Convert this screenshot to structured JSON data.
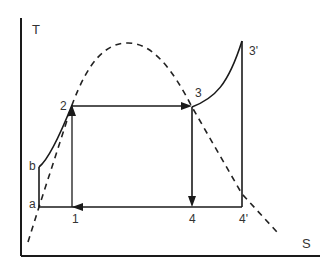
{
  "diagram": {
    "type": "T-S diagram (Rankine cycle with superheat)",
    "axes": {
      "y_label": "T",
      "x_label": "S"
    },
    "points": {
      "a": "a",
      "b": "b",
      "p1": "1",
      "p2": "2",
      "p3": "3",
      "p3_prime": "3'",
      "p4": "4",
      "p4_prime": "4'"
    },
    "colors": {
      "line": "#1a1a1a",
      "dome": "#222222",
      "text": "#333333",
      "background": "#ffffff"
    },
    "elements": [
      {
        "id": "saturation-dome",
        "style": "dashed",
        "description": "bell-shaped saturation curve"
      },
      {
        "id": "line-a-b",
        "from": "a",
        "to": "b",
        "style": "solid"
      },
      {
        "id": "curve-b-2",
        "from": "b",
        "to": "2",
        "style": "solid"
      },
      {
        "id": "line-1-2",
        "from": "1",
        "to": "2",
        "style": "solid",
        "arrow": "up"
      },
      {
        "id": "line-2-3",
        "from": "2",
        "to": "3",
        "style": "solid",
        "arrow": "right"
      },
      {
        "id": "curve-3-3prime",
        "from": "3",
        "to": "3'",
        "style": "solid"
      },
      {
        "id": "line-3-4",
        "from": "3",
        "to": "4",
        "style": "solid",
        "arrow": "down"
      },
      {
        "id": "line-3prime-4prime",
        "from": "3'",
        "to": "4'",
        "style": "solid"
      },
      {
        "id": "line-4prime-a",
        "from": "4'",
        "to": "a",
        "style": "solid",
        "arrow": "left at 1"
      }
    ]
  }
}
